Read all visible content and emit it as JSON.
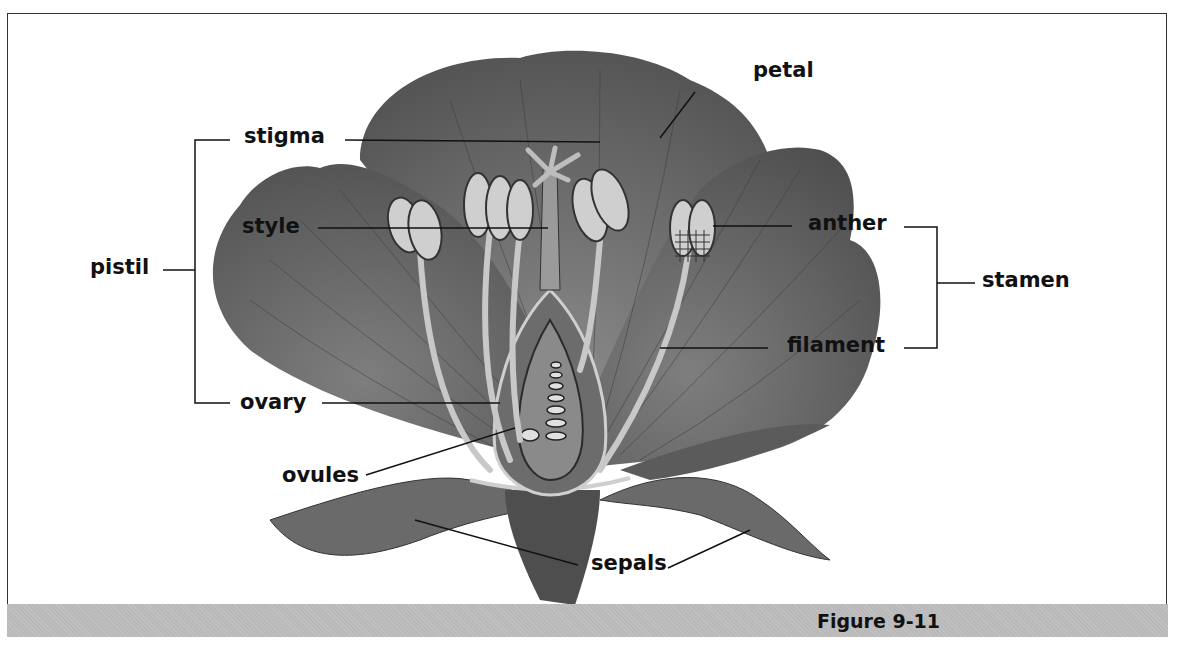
{
  "figure": {
    "caption": "Figure 9-11"
  },
  "labels": {
    "petal": "petal",
    "stigma": "stigma",
    "style": "style",
    "pistil": "pistil",
    "ovary": "ovary",
    "ovules": "ovules",
    "anther": "anther",
    "stamen": "stamen",
    "filament": "filament",
    "sepals": "sepals"
  },
  "groups": {
    "pistil": [
      "stigma",
      "style",
      "ovary"
    ],
    "stamen": [
      "anther",
      "filament"
    ]
  },
  "colors": {
    "caption_bar": "#b9b9b9",
    "petal_dark": "#5a5a5a",
    "petal_mid": "#7a7a7a",
    "anther": "#c8c8c8",
    "line": "#111111"
  }
}
